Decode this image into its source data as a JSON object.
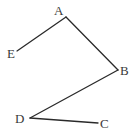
{
  "diagram": {
    "type": "polyline-figure",
    "width": 139,
    "height": 132,
    "line_color": "#2a2a2a",
    "label_color": "#3a3a3a",
    "points": {
      "A": {
        "x": 66,
        "y": 17,
        "label": "A",
        "lx": 54,
        "ly": 15
      },
      "B": {
        "x": 118,
        "y": 70,
        "label": "B",
        "lx": 120,
        "ly": 75
      },
      "C": {
        "x": 98,
        "y": 123,
        "label": "C",
        "lx": 100,
        "ly": 128
      },
      "D": {
        "x": 30,
        "y": 118,
        "label": "D",
        "lx": 15,
        "ly": 123
      },
      "E": {
        "x": 17,
        "y": 51,
        "label": "E",
        "lx": 7,
        "ly": 58
      }
    },
    "segments": [
      {
        "from": "E",
        "to": "A"
      },
      {
        "from": "A",
        "to": "B"
      },
      {
        "from": "B",
        "to": "D"
      },
      {
        "from": "D",
        "to": "C"
      }
    ],
    "labels": {
      "A": "A",
      "B": "B",
      "C": "C",
      "D": "D",
      "E": "E"
    }
  }
}
